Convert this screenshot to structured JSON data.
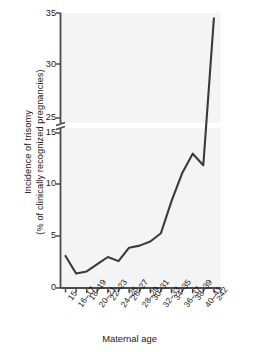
{
  "chart_data": {
    "type": "line",
    "title": "",
    "xlabel": "Maternal age",
    "ylabel_line1": "Incidence of trisomy",
    "ylabel_line2": "(% of clinically recognized pregnancies)",
    "categories": [
      "15",
      "16–17",
      "18–19",
      "20–21",
      "22–23",
      "24–25",
      "26–27",
      "28–29",
      "30–31",
      "32–33",
      "34–35",
      "36–37",
      "38–39",
      "40–41",
      "≥42"
    ],
    "values": [
      3.1,
      1.4,
      1.6,
      2.3,
      3.0,
      2.6,
      3.9,
      4.1,
      4.5,
      5.3,
      8.4,
      11.1,
      13.0,
      20.5,
      34.5
    ],
    "series": [
      {
        "name": "Incidence of trisomy",
        "values": [
          3.1,
          1.4,
          1.6,
          2.3,
          3.0,
          2.6,
          3.9,
          4.1,
          4.5,
          5.3,
          8.4,
          11.1,
          13.0,
          20.5,
          34.5
        ]
      }
    ],
    "y_ticks_lower": [
      0,
      5,
      10,
      15
    ],
    "y_ticks_upper": [
      25,
      30,
      35
    ],
    "ylim_lower": [
      0,
      15
    ],
    "ylim_upper": [
      25,
      35
    ],
    "axis_break": true,
    "axis_break_between": [
      15,
      25
    ],
    "grid": false,
    "legend": "none",
    "line_color": "#3a3a3a",
    "plot_background": "#f4f4f4",
    "axis_color": "#4a4a4a"
  },
  "axes": {
    "y_tick_labels": [
      "35",
      "30",
      "25",
      "15",
      "10",
      "5",
      "0"
    ],
    "x_tick_labels": [
      "15",
      "16–17",
      "18–19",
      "20–21",
      "22–23",
      "24–25",
      "26–27",
      "28–29",
      "30–31",
      "32–33",
      "34–35",
      "36–37",
      "38–39",
      "40–41",
      "≥42"
    ],
    "x_title": "Maternal age",
    "y_title_line1": "Incidence of trisomy",
    "y_title_line2": "(% of clinically recognized pregnancies)"
  }
}
